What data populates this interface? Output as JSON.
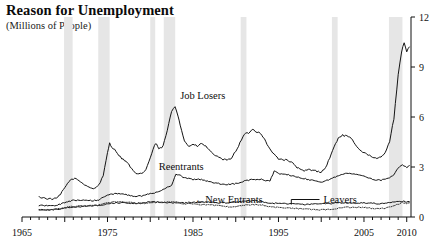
{
  "header": {
    "title": "Reason for Unemployment",
    "subtitle": "(Millions of People)"
  },
  "chart_data": {
    "type": "line",
    "title": "Reason for Unemployment",
    "subtitle": "(Millions of People)",
    "xlabel": "",
    "ylabel": "Millions of People",
    "xlim": [
      1965,
      2010.5
    ],
    "ylim": [
      0,
      12
    ],
    "grid": false,
    "legend_position": "inline-annotations",
    "y_axis_side": "right",
    "y_ticks": [
      "0",
      "3",
      "6",
      "9",
      "12"
    ],
    "y_tick_values": [
      0,
      3,
      6,
      9,
      12
    ],
    "x_ticks": [
      "1965",
      "1975",
      "1985",
      "1995",
      "2005",
      "2010"
    ],
    "x_tick_values": [
      1965,
      1975,
      1985,
      1995,
      2005,
      2010
    ],
    "x_minor_tick_interval": 1,
    "annotations": [
      {
        "text": "Job Losers",
        "x": 1983.5,
        "y": 7.1
      },
      {
        "text": "Reentrants",
        "x": 1981.0,
        "y": 2.85
      },
      {
        "text": "New Entrants",
        "x": 1985.2,
        "y": 0.85,
        "arrow": "←"
      },
      {
        "text": "Leavers",
        "x": 1999.8,
        "y": 1.05,
        "leader": "elbow-left"
      }
    ],
    "recession_bands": [
      {
        "start": 1969.92,
        "end": 1970.92
      },
      {
        "start": 1973.92,
        "end": 1975.25
      },
      {
        "start": 1980.0,
        "end": 1980.58
      },
      {
        "start": 1981.58,
        "end": 1982.92
      },
      {
        "start": 1990.58,
        "end": 1991.25
      },
      {
        "start": 2001.25,
        "end": 2001.92
      },
      {
        "start": 2007.92,
        "end": 2009.5
      }
    ],
    "recession_band_color": "#e6e6e6",
    "series": [
      {
        "name": "Job Losers",
        "color": "#141414",
        "style": "solid",
        "x": [
          1967.0,
          1967.5,
          1968.0,
          1968.5,
          1969.0,
          1969.5,
          1970.0,
          1970.5,
          1971.0,
          1971.5,
          1972.0,
          1972.5,
          1973.0,
          1973.5,
          1974.0,
          1974.5,
          1975.0,
          1975.25,
          1975.5,
          1976.0,
          1976.5,
          1977.0,
          1977.5,
          1978.0,
          1978.5,
          1979.0,
          1979.5,
          1980.0,
          1980.5,
          1980.75,
          1981.0,
          1981.5,
          1982.0,
          1982.5,
          1982.9,
          1983.25,
          1983.5,
          1984.0,
          1984.5,
          1985.0,
          1985.5,
          1986.0,
          1986.5,
          1987.0,
          1987.5,
          1988.0,
          1988.5,
          1989.0,
          1989.5,
          1990.0,
          1990.5,
          1991.0,
          1991.5,
          1992.0,
          1992.5,
          1992.9,
          1993.5,
          1994.0,
          1994.5,
          1995.0,
          1995.5,
          1996.0,
          1996.5,
          1997.0,
          1997.5,
          1998.0,
          1998.5,
          1999.0,
          1999.5,
          2000.0,
          2000.5,
          2001.0,
          2001.5,
          2002.0,
          2002.5,
          2003.0,
          2003.5,
          2004.0,
          2004.5,
          2005.0,
          2005.5,
          2006.0,
          2006.5,
          2007.0,
          2007.5,
          2008.0,
          2008.5,
          2009.0,
          2009.4,
          2009.7,
          2010.0,
          2010.3
        ],
        "y": [
          1.2,
          1.15,
          1.1,
          1.08,
          1.1,
          1.35,
          1.75,
          2.15,
          2.3,
          2.25,
          2.05,
          1.9,
          1.75,
          1.7,
          1.95,
          2.45,
          3.85,
          4.45,
          4.2,
          3.95,
          3.6,
          3.4,
          3.15,
          2.75,
          2.55,
          2.6,
          2.85,
          3.55,
          4.3,
          4.4,
          4.05,
          4.25,
          5.2,
          6.35,
          6.65,
          6.1,
          5.55,
          4.55,
          4.25,
          4.35,
          4.25,
          4.4,
          4.25,
          3.95,
          3.75,
          3.55,
          3.45,
          3.4,
          3.55,
          3.95,
          4.45,
          4.95,
          5.05,
          5.25,
          5.1,
          5.05,
          4.55,
          4.05,
          3.75,
          3.5,
          3.45,
          3.4,
          3.3,
          3.05,
          2.85,
          2.75,
          2.85,
          2.8,
          2.75,
          2.7,
          2.95,
          3.55,
          4.2,
          4.75,
          4.9,
          4.85,
          4.7,
          4.35,
          4.05,
          3.85,
          3.75,
          3.55,
          3.5,
          3.6,
          3.9,
          4.55,
          5.9,
          8.5,
          9.9,
          10.5,
          9.9,
          10.2
        ]
      },
      {
        "name": "Reentrants",
        "color": "#141414",
        "style": "solid",
        "x": [
          1967.0,
          1968.0,
          1969.0,
          1970.0,
          1971.0,
          1972.0,
          1973.0,
          1974.0,
          1975.0,
          1976.0,
          1977.0,
          1978.0,
          1979.0,
          1980.0,
          1981.0,
          1982.0,
          1982.5,
          1983.0,
          1983.5,
          1984.0,
          1985.0,
          1986.0,
          1987.0,
          1988.0,
          1989.0,
          1990.0,
          1991.0,
          1992.0,
          1993.0,
          1994.0,
          1994.5,
          1995.0,
          1996.0,
          1997.0,
          1998.0,
          1999.0,
          2000.0,
          2001.0,
          2002.0,
          2003.0,
          2004.0,
          2005.0,
          2006.0,
          2007.0,
          2008.0,
          2008.5,
          2009.0,
          2009.5,
          2010.0,
          2010.3
        ],
        "y": [
          0.7,
          0.68,
          0.7,
          0.85,
          1.0,
          1.02,
          0.98,
          1.0,
          1.35,
          1.4,
          1.35,
          1.25,
          1.25,
          1.4,
          1.5,
          1.8,
          1.9,
          2.55,
          2.5,
          2.35,
          2.25,
          2.25,
          2.1,
          2.0,
          1.95,
          2.0,
          2.15,
          2.25,
          2.25,
          2.15,
          2.75,
          2.6,
          2.55,
          2.4,
          2.3,
          2.2,
          2.1,
          2.25,
          2.5,
          2.65,
          2.55,
          2.45,
          2.25,
          2.2,
          2.35,
          2.5,
          2.95,
          3.15,
          2.95,
          3.1
        ]
      },
      {
        "name": "Leavers",
        "color": "#141414",
        "style": "solid",
        "x": [
          1967.0,
          1968.0,
          1969.0,
          1970.0,
          1971.0,
          1972.0,
          1973.0,
          1974.0,
          1975.0,
          1976.0,
          1977.0,
          1978.0,
          1979.0,
          1980.0,
          1981.0,
          1982.0,
          1983.0,
          1984.0,
          1985.0,
          1986.0,
          1987.0,
          1988.0,
          1989.0,
          1990.0,
          1991.0,
          1992.0,
          1993.0,
          1994.0,
          1995.0,
          1996.0,
          1997.0,
          1998.0,
          1999.0,
          2000.0,
          2001.0,
          2002.0,
          2003.0,
          2004.0,
          2005.0,
          2006.0,
          2007.0,
          2008.0,
          2009.0,
          2009.5,
          2010.0,
          2010.3
        ],
        "y": [
          0.45,
          0.43,
          0.45,
          0.55,
          0.6,
          0.62,
          0.65,
          0.7,
          0.8,
          0.85,
          0.85,
          0.82,
          0.82,
          0.9,
          0.9,
          0.85,
          0.85,
          0.85,
          0.88,
          0.9,
          0.9,
          0.85,
          0.85,
          0.9,
          0.95,
          0.98,
          0.95,
          0.82,
          0.82,
          0.8,
          0.78,
          0.75,
          0.78,
          0.78,
          0.8,
          0.85,
          0.85,
          0.84,
          0.85,
          0.82,
          0.8,
          0.85,
          0.92,
          0.95,
          0.9,
          0.92
        ]
      },
      {
        "name": "New Entrants",
        "color": "#333333",
        "style": "dotted",
        "x": [
          1967.0,
          1968.0,
          1969.0,
          1970.0,
          1971.0,
          1972.0,
          1973.0,
          1974.0,
          1975.0,
          1976.0,
          1977.0,
          1978.0,
          1979.0,
          1980.0,
          1981.0,
          1982.0,
          1983.0,
          1984.0,
          1985.0,
          1986.0,
          1987.0,
          1988.0,
          1989.0,
          1990.0,
          1991.0,
          1992.0,
          1993.0,
          1994.0,
          1995.0,
          1996.0,
          1997.0,
          1998.0,
          1999.0,
          2000.0,
          2001.0,
          2002.0,
          2003.0,
          2004.0,
          2005.0,
          2006.0,
          2007.0,
          2008.0,
          2009.0,
          2009.5,
          2010.0,
          2010.3
        ],
        "y": [
          0.4,
          0.42,
          0.45,
          0.55,
          0.63,
          0.65,
          0.68,
          0.7,
          0.85,
          0.9,
          0.9,
          0.85,
          0.82,
          0.85,
          0.88,
          0.9,
          0.88,
          0.8,
          0.78,
          0.75,
          0.72,
          0.68,
          0.62,
          0.62,
          0.72,
          0.75,
          0.72,
          0.62,
          0.58,
          0.55,
          0.52,
          0.48,
          0.45,
          0.42,
          0.45,
          0.52,
          0.58,
          0.58,
          0.56,
          0.52,
          0.5,
          0.58,
          0.78,
          0.88,
          0.82,
          0.85
        ]
      }
    ]
  }
}
